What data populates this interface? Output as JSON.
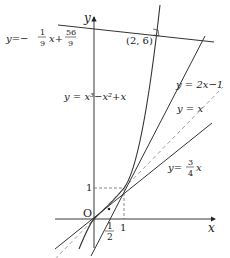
{
  "diagram": {
    "type": "function-graph",
    "axes": {
      "x_label": "x",
      "y_label": "y",
      "origin_label": "O"
    },
    "ticks": {
      "x_one": "1",
      "y_one": "1",
      "x_half_num": "1",
      "x_half_den": "2"
    },
    "point_label": "(2, 6)",
    "curves": [
      {
        "name": "cubic",
        "label": "y = x³−x²+x",
        "expr": "x^3-x^2+x"
      },
      {
        "name": "tangent",
        "label": "y = 2x−1",
        "expr": "2x-1"
      },
      {
        "name": "identity",
        "label": "y = x",
        "expr": "x",
        "style": "dashed"
      },
      {
        "name": "three-quarter",
        "label_prefix": "y=",
        "num": "3",
        "den": "4",
        "suffix": "x",
        "expr": "3/4 x"
      },
      {
        "name": "normal",
        "label_prefix": "y=−",
        "num": "1",
        "den": "9",
        "mid": "x+",
        "num2": "56",
        "den2": "9",
        "expr": "-1/9 x + 56/9"
      }
    ],
    "colors": {
      "line": "#333333",
      "dash": "#777777"
    }
  }
}
